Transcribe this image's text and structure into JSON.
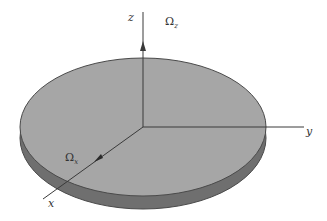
{
  "figure": {
    "colors": {
      "disk_top": "#a6a6a6",
      "disk_rim": "#6f6f6f",
      "outline": "#4a4a4a",
      "axis": "#3a3a3a",
      "background": "#ffffff"
    },
    "axes": {
      "z": {
        "label": "z"
      },
      "y": {
        "label": "y"
      },
      "x": {
        "label": "x"
      }
    },
    "angular_velocities": {
      "omega_z": {
        "symbol": "Ω",
        "subscript": "z"
      },
      "omega_x": {
        "symbol": "Ω",
        "subscript": "x"
      }
    }
  }
}
